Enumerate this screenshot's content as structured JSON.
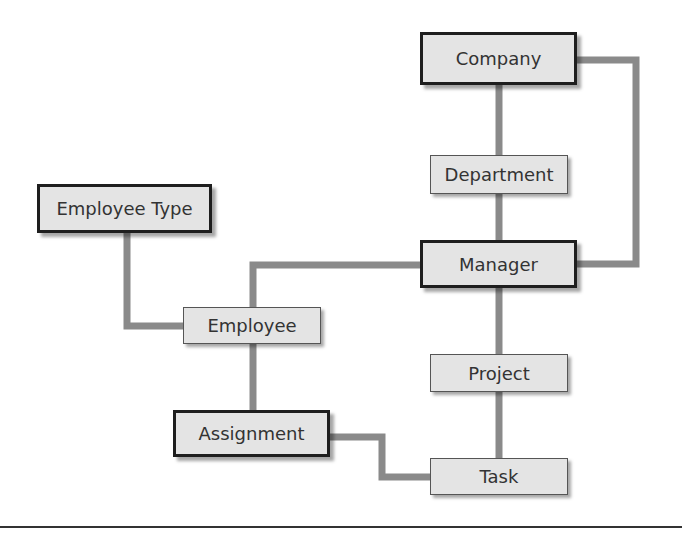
{
  "diagram": {
    "type": "entity-relationship",
    "connector_color": "#8a8a8a",
    "box_fill": "#e4e4e4",
    "text_color": "#333333",
    "entities": [
      {
        "id": "company",
        "label": "Company",
        "style": "major",
        "x": 420,
        "y": 32,
        "w": 157,
        "h": 53
      },
      {
        "id": "department",
        "label": "Department",
        "style": "minor",
        "x": 430,
        "y": 155,
        "w": 138,
        "h": 39
      },
      {
        "id": "employee_type",
        "label": "Employee Type",
        "style": "major",
        "x": 37,
        "y": 184,
        "w": 175,
        "h": 49
      },
      {
        "id": "manager",
        "label": "Manager",
        "style": "major",
        "x": 420,
        "y": 240,
        "w": 157,
        "h": 48
      },
      {
        "id": "employee",
        "label": "Employee",
        "style": "minor",
        "x": 183,
        "y": 307,
        "w": 138,
        "h": 37
      },
      {
        "id": "project",
        "label": "Project",
        "style": "minor",
        "x": 430,
        "y": 354,
        "w": 138,
        "h": 38
      },
      {
        "id": "assignment",
        "label": "Assignment",
        "style": "major",
        "x": 173,
        "y": 410,
        "w": 157,
        "h": 47
      },
      {
        "id": "task",
        "label": "Task",
        "style": "minor",
        "x": 430,
        "y": 458,
        "w": 138,
        "h": 37
      }
    ],
    "relationships": [
      {
        "from": "company",
        "to": "department",
        "points": "499,85 499,155"
      },
      {
        "from": "department",
        "to": "manager",
        "points": "499,194 499,240"
      },
      {
        "from": "company",
        "to": "manager",
        "points": "577,60 636,60 636,264 577,264"
      },
      {
        "from": "manager",
        "to": "employee",
        "points": "420,265 253,265 253,307"
      },
      {
        "from": "employee_type",
        "to": "employee",
        "points": "127,233 127,326 183,326"
      },
      {
        "from": "employee",
        "to": "assignment",
        "points": "253,344 253,410"
      },
      {
        "from": "manager",
        "to": "project",
        "points": "499,288 499,354"
      },
      {
        "from": "project",
        "to": "task",
        "points": "499,392 499,458"
      },
      {
        "from": "assignment",
        "to": "task",
        "points": "330,437 382,437 382,477 430,477"
      }
    ]
  }
}
